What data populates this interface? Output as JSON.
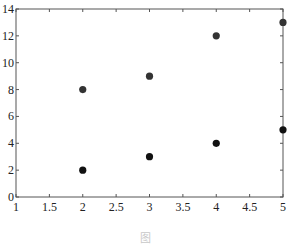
{
  "chart_data": {
    "type": "scatter",
    "title": "",
    "xlabel": "",
    "ylabel": "",
    "xlim": [
      1,
      5
    ],
    "ylim": [
      0,
      14
    ],
    "xticks": [
      "1",
      "1.5",
      "2",
      "2.5",
      "3",
      "3.5",
      "4",
      "4.5",
      "5"
    ],
    "xtick_values": [
      1,
      1.5,
      2,
      2.5,
      3,
      3.5,
      4,
      4.5,
      5
    ],
    "yticks": [
      "0",
      "2",
      "4",
      "6",
      "8",
      "10",
      "12",
      "14"
    ],
    "ytick_values": [
      0,
      2,
      4,
      6,
      8,
      10,
      12,
      14
    ],
    "grid": false,
    "legend": null,
    "series": [
      {
        "name": "lower",
        "color": "#111111",
        "points": [
          [
            2,
            2
          ],
          [
            3,
            3
          ],
          [
            4,
            4
          ],
          [
            5,
            5
          ]
        ]
      },
      {
        "name": "upper",
        "color": "#333333",
        "points": [
          [
            2,
            8
          ],
          [
            3,
            9
          ],
          [
            4,
            12
          ],
          [
            5,
            13
          ]
        ]
      }
    ]
  },
  "caption": "图"
}
